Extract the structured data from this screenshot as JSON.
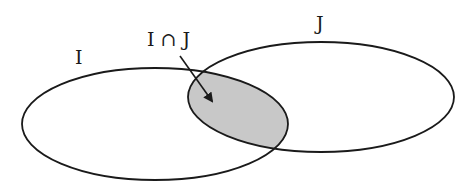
{
  "diagram": {
    "type": "venn",
    "sets": [
      {
        "id": "I",
        "label": "I"
      },
      {
        "id": "J",
        "label": "J"
      }
    ],
    "intersection": {
      "label": "I ∩ J",
      "fill": "#c8c8c8"
    },
    "stroke_color": "#1a1a1a",
    "background": "#ffffff"
  }
}
